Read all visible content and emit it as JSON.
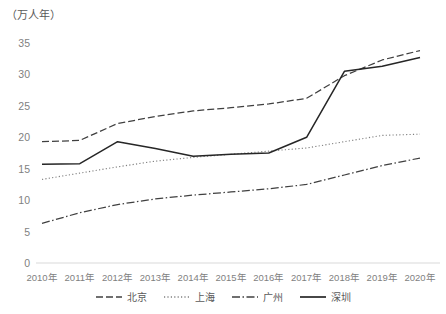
{
  "chart_data": {
    "type": "line",
    "title": "",
    "unit_label": "（万人年）",
    "xlabel": "",
    "ylabel": "",
    "ylim": [
      0,
      35
    ],
    "yticks": [
      0,
      5,
      10,
      15,
      20,
      25,
      30,
      35
    ],
    "grid": false,
    "legend_position": "bottom",
    "categories": [
      "2010年",
      "2011年",
      "2012年",
      "2013年",
      "2014年",
      "2015年",
      "2016年",
      "2017年",
      "2018年",
      "2019年",
      "2020年"
    ],
    "series": [
      {
        "name": "北京",
        "style": "dashed",
        "color": "#404040",
        "values": [
          19.3,
          19.5,
          22.2,
          23.3,
          24.2,
          24.7,
          25.3,
          26.2,
          29.8,
          32.3,
          33.8
        ]
      },
      {
        "name": "上海",
        "style": "dotted",
        "color": "#808080",
        "values": [
          13.3,
          14.3,
          15.3,
          16.2,
          16.8,
          17.3,
          17.8,
          18.3,
          19.3,
          20.3,
          20.5
        ]
      },
      {
        "name": "广州",
        "style": "dashdot",
        "color": "#404040",
        "values": [
          6.3,
          8.0,
          9.3,
          10.2,
          10.8,
          11.3,
          11.8,
          12.5,
          14.0,
          15.5,
          16.7
        ]
      },
      {
        "name": "深圳",
        "style": "solid",
        "color": "#262626",
        "values": [
          15.7,
          15.8,
          19.3,
          18.2,
          17.0,
          17.3,
          17.5,
          20.0,
          30.5,
          31.3,
          32.7
        ]
      }
    ]
  },
  "axis": {
    "y_tick_labels": [
      "35",
      "30",
      "25",
      "20",
      "15",
      "10",
      "5",
      "0"
    ],
    "x_tick_labels": [
      "2010年",
      "2011年",
      "2012年",
      "2013年",
      "2014年",
      "2015年",
      "2016年",
      "2017年",
      "2018年",
      "2019年",
      "2020年"
    ]
  },
  "legend": {
    "items": [
      {
        "label": "北京"
      },
      {
        "label": "上海"
      },
      {
        "label": "广州"
      },
      {
        "label": "深圳"
      }
    ]
  }
}
